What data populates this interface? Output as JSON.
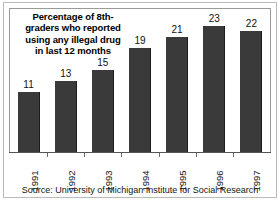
{
  "chart_data": {
    "type": "bar",
    "title_lines": [
      "Percentage of 8th-",
      "graders who reported",
      "using any illegal drug",
      "in last 12 months"
    ],
    "categories": [
      "1991",
      "1992",
      "1993",
      "1994",
      "1995",
      "1996",
      "1997"
    ],
    "values": [
      11,
      13,
      15,
      19,
      21,
      23,
      22
    ],
    "xlabel": "",
    "ylabel": "",
    "ylim": [
      0,
      26
    ],
    "grid": false,
    "legend": false,
    "bar_color": "#3a3a3a",
    "axis_color": "#555555",
    "text_color": "#111111",
    "data_labels": [
      "11",
      "13",
      "15",
      "19",
      "21",
      "23",
      "22"
    ],
    "source": "Source: University of Michigan Institute for Social Research"
  }
}
